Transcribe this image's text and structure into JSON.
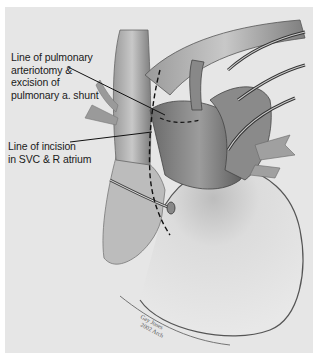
{
  "figure": {
    "labels": [
      {
        "id": "pulmonary-arteriotomy",
        "text": "Line of pulmonary\narteriotomy &\nexcision of\npulmonary a. shunt"
      },
      {
        "id": "svc-incision",
        "text": "Line of incision\nin SVC & R atrium"
      }
    ],
    "signature": "Gay Jones\n2002 Arch",
    "colors": {
      "background": "#e6e6e6",
      "border": "#ffffff",
      "text": "#1a1a1a",
      "leader_line": "#111111"
    }
  }
}
